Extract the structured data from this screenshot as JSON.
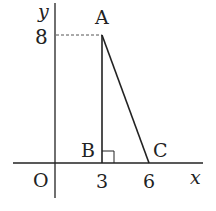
{
  "diagram": {
    "type": "coordinate-triangle",
    "axes": {
      "x_label": "x",
      "y_label": "y",
      "origin_label": "O"
    },
    "ticks": {
      "x": [
        "3",
        "6"
      ],
      "y": [
        "8"
      ]
    },
    "points": {
      "A": {
        "label": "A",
        "coords": [
          3,
          8
        ]
      },
      "B": {
        "label": "B",
        "coords": [
          3,
          0
        ]
      },
      "C": {
        "label": "C",
        "coords": [
          6,
          0
        ]
      }
    },
    "right_angle_at": "B",
    "dashed_guide": "from y-axis at 8 to A",
    "colors": {
      "line": "#222222",
      "dashed": "#555555",
      "background": "#ffffff"
    }
  }
}
